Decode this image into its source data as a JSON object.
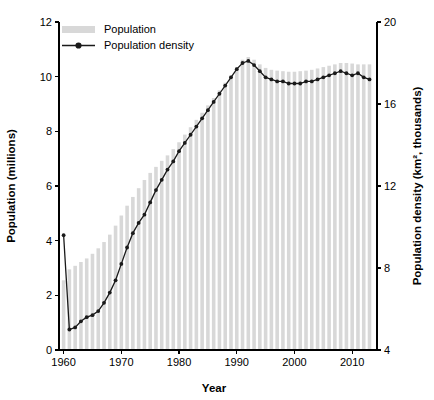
{
  "chart_data": {
    "type": "bar",
    "title": "",
    "xlabel": "Year",
    "ylabel": "Population (millions)",
    "y2label": "Population density (km², thousands)",
    "xlim": [
      1959.2,
      2014.3
    ],
    "ylim": [
      0,
      12
    ],
    "y2lim": [
      4,
      20
    ],
    "grid": false,
    "legend_position": "top-left",
    "xticks": [
      "1960",
      "1970",
      "1980",
      "1990",
      "2000",
      "2010"
    ],
    "xtick_values": [
      1960,
      1970,
      1980,
      1990,
      2000,
      2010
    ],
    "yticks": [
      "0",
      "2",
      "4",
      "6",
      "8",
      "10",
      "12"
    ],
    "ytick_values": [
      0,
      2,
      4,
      6,
      8,
      10,
      12
    ],
    "y2ticks": [
      "4",
      "8",
      "12",
      "16",
      "20"
    ],
    "y2tick_values": [
      4,
      8,
      12,
      16,
      20
    ],
    "x": [
      1960,
      1961,
      1962,
      1963,
      1964,
      1965,
      1966,
      1967,
      1968,
      1969,
      1970,
      1971,
      1972,
      1973,
      1974,
      1975,
      1976,
      1977,
      1978,
      1979,
      1980,
      1981,
      1982,
      1983,
      1984,
      1985,
      1986,
      1987,
      1988,
      1989,
      1990,
      1991,
      1992,
      1993,
      1994,
      1995,
      1996,
      1997,
      1998,
      1999,
      2000,
      2001,
      2002,
      2003,
      2004,
      2005,
      2006,
      2007,
      2008,
      2009,
      2010,
      2011,
      2012,
      2013
    ],
    "series": [
      {
        "name": "Population",
        "type": "bar",
        "axis": "left",
        "unit": "millions",
        "color": "#d8d8d8",
        "values": [
          2.55,
          2.95,
          3.08,
          3.22,
          3.35,
          3.52,
          3.72,
          3.95,
          4.22,
          4.55,
          4.92,
          5.28,
          5.6,
          5.92,
          6.22,
          6.48,
          6.7,
          6.92,
          7.12,
          7.35,
          7.6,
          7.88,
          8.15,
          8.42,
          8.68,
          8.95,
          9.22,
          9.5,
          9.78,
          10.05,
          10.35,
          10.62,
          10.72,
          10.62,
          10.45,
          10.32,
          10.25,
          10.22,
          10.2,
          10.18,
          10.18,
          10.2,
          10.22,
          10.25,
          10.3,
          10.35,
          10.4,
          10.45,
          10.5,
          10.5,
          10.48,
          10.45,
          10.45,
          10.45
        ]
      },
      {
        "name": "Population density",
        "type": "line",
        "axis": "right",
        "unit": "km² thousands",
        "color": "#1a1a1a",
        "values": [
          9.6,
          5.0,
          5.1,
          5.4,
          5.6,
          5.7,
          5.9,
          6.3,
          6.8,
          7.4,
          8.2,
          9.0,
          9.7,
          10.2,
          10.6,
          11.2,
          11.8,
          12.3,
          12.8,
          13.2,
          13.7,
          14.1,
          14.5,
          14.9,
          15.3,
          15.7,
          16.1,
          16.5,
          16.9,
          17.3,
          17.7,
          18.0,
          18.1,
          17.9,
          17.6,
          17.3,
          17.2,
          17.1,
          17.1,
          17.0,
          17.0,
          17.0,
          17.1,
          17.1,
          17.2,
          17.3,
          17.4,
          17.5,
          17.6,
          17.5,
          17.4,
          17.5,
          17.3,
          17.2
        ]
      }
    ]
  },
  "legend": {
    "items": [
      {
        "label": "Population",
        "marker": "bar-swatch"
      },
      {
        "label": "Population density",
        "marker": "line-dot"
      }
    ]
  }
}
